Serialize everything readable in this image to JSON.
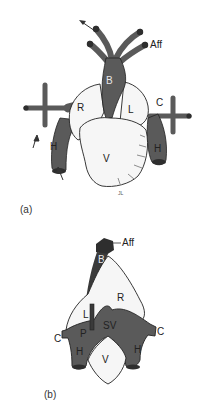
{
  "figure": {
    "colors": {
      "vessel": "#5a5a5a",
      "vessel_dark": "#2e2e2e",
      "chamber": "#f6f6f6",
      "outline": "#222222",
      "background": "#ffffff"
    },
    "panel_a": {
      "caption": "(a)",
      "labels": {
        "aff": "Aff",
        "b": "B",
        "r": "R",
        "l": "L",
        "c_left": "C",
        "c_right": "C",
        "h_left": "H",
        "h_right": "H",
        "v": "V",
        "signature": "JL"
      }
    },
    "panel_b": {
      "caption": "(b)",
      "labels": {
        "aff": "Aff",
        "b": "B",
        "r": "R",
        "l": "L",
        "sv": "SV",
        "p": "P",
        "c_left": "C",
        "c_right": "C",
        "h_left": "H",
        "h_right": "H",
        "v": "V"
      }
    }
  }
}
